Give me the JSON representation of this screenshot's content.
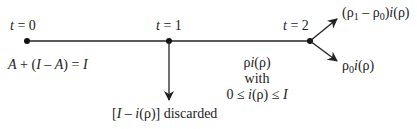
{
  "diagram": {
    "time_labels": [
      {
        "id": "t0",
        "var": "t",
        "eq": " = 0"
      },
      {
        "id": "t1",
        "var": "t",
        "eq": " = 1"
      },
      {
        "id": "t2",
        "var": "t",
        "eq": " = 2"
      }
    ],
    "initial_label": {
      "a1": "A",
      "mid": " + (",
      "i1": "I",
      "minus": " – ",
      "a2": "A",
      "close": ") = ",
      "i2": "I"
    },
    "discard_label": {
      "open": "[",
      "i": "I",
      "minus": " – ",
      "fn": "i",
      "arg": "(ρ)",
      "close": "]",
      "text": " discarded"
    },
    "middle_label": {
      "line1_rho": "ρ",
      "line1_fn": "i",
      "line1_arg": "(ρ)",
      "line2": "with",
      "line3_pre": "0 ≤ ",
      "line3_fn": "i",
      "line3_arg": "(ρ) ≤ ",
      "line3_I": "I"
    },
    "upper_branch_label": {
      "open": "(ρ",
      "sub1": "1",
      "minus": " – ρ",
      "sub0": "0",
      "close": ")",
      "fn": "i",
      "arg": "(ρ)"
    },
    "lower_branch_label": {
      "rho": "ρ",
      "sub0": "0",
      "fn": "i",
      "arg": "(ρ)"
    },
    "colors": {
      "line": "#222222",
      "arrow": "#222222",
      "text": "#222222"
    }
  }
}
